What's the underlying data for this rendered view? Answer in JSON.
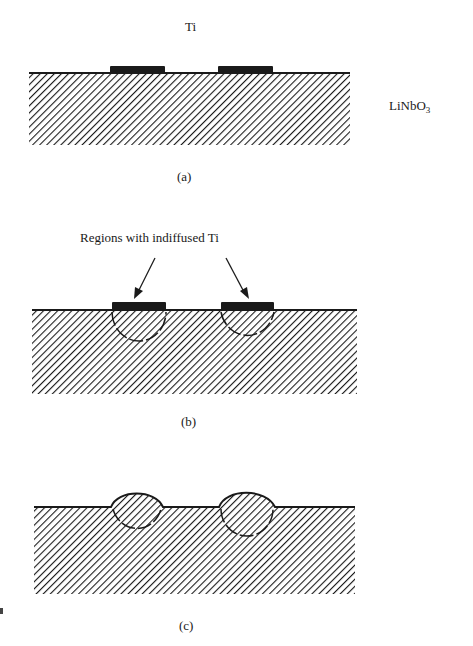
{
  "figure": {
    "panels": [
      {
        "id": "a",
        "caption": "(a)",
        "description": "Ti strips deposited on LiNbO3 substrate"
      },
      {
        "id": "b",
        "caption": "(b)",
        "description": "Ti indiffused into substrate beneath strips"
      },
      {
        "id": "c",
        "caption": "(c)",
        "description": "Indiffused regions bulging above surface"
      }
    ],
    "labels": {
      "ti": "Ti",
      "substrate_main": "LiNbO",
      "substrate_sub": "3",
      "annotation_b": "Regions with indiffused Ti"
    },
    "colors": {
      "ink": "#1a1a1a",
      "background": "#ffffff"
    }
  }
}
